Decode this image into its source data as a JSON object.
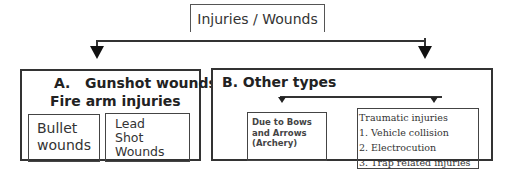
{
  "root": {
    "label": "Injuries / Wounds"
  },
  "category_a": {
    "title_line1": "A.   Gunshot wounds-",
    "title_line2": "Fire arm injuries",
    "children": [
      {
        "label_lines": [
          "Bullet",
          "wounds"
        ]
      },
      {
        "label_lines": [
          "Lead",
          "Shot",
          "Wounds"
        ]
      }
    ]
  },
  "category_b": {
    "title": "B. Other types",
    "children": [
      {
        "label_lines": [
          "Due to Bows",
          "and Arrows",
          "(Archery)"
        ]
      },
      {
        "title": "Traumatic injuries",
        "items": [
          "1. Vehicle collision",
          "2. Electrocution",
          "3. Trap related injuries"
        ]
      }
    ]
  }
}
